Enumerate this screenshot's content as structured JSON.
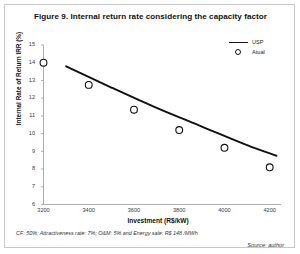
{
  "figure": {
    "title": "Figure 9. Internal return rate considering the capacity factor",
    "note_params": "CF: 50%; Attractiveness rate: 7%; O&M: 5% and Energy sale: R$ 148 /MWh",
    "note_source": "Source: author"
  },
  "legend": {
    "position": "top-right",
    "items": [
      {
        "label": "USP",
        "key": "line",
        "color": "#111111"
      },
      {
        "label": "Atual",
        "key": "circle-marker",
        "color": "#111111"
      }
    ]
  },
  "chart_data": {
    "type": "scatter",
    "title": "Figure 9. Internal return rate considering the capacity factor",
    "xlabel": "Investment (R$/kW)",
    "ylabel": "Internal Rate of Return IRR (%)",
    "xlim": [
      3200,
      4250
    ],
    "ylim": [
      6,
      15
    ],
    "xticks": [
      3200,
      3400,
      3600,
      3800,
      4000,
      4200
    ],
    "yticks": [
      6,
      7,
      8,
      9,
      10,
      11,
      12,
      13,
      14,
      15
    ],
    "grid": false,
    "legend_position": "top-right",
    "series": [
      {
        "name": "Atual",
        "type": "scatter",
        "marker": "open-circle",
        "color": "#111111",
        "x": [
          3200,
          3400,
          3600,
          3800,
          4000,
          4200
        ],
        "values": [
          14.0,
          12.75,
          11.35,
          10.2,
          9.2,
          8.1
        ]
      },
      {
        "name": "USP",
        "type": "line",
        "color": "#111111",
        "x": [
          3300,
          3500,
          3700,
          3900,
          4100,
          4230
        ],
        "values": [
          13.8,
          12.6,
          11.45,
          10.4,
          9.35,
          8.75
        ]
      }
    ],
    "annotations": [
      "CF: 50%; Attractiveness rate: 7%; O&M: 5% and Energy sale: R$ 148 /MWh",
      "Source: author"
    ]
  }
}
